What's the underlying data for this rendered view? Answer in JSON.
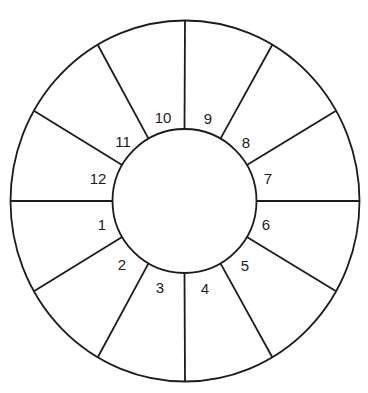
{
  "diagram": {
    "type": "segmented-ring",
    "center": [
      184.5,
      201
    ],
    "outer_radius": 178,
    "inner_radius": 72,
    "stroke_color": "#1c1c1c",
    "segment_count": 12,
    "segments": [
      {
        "label": "1",
        "x": 102,
        "y": 224
      },
      {
        "label": "2",
        "x": 122,
        "y": 264
      },
      {
        "label": "3",
        "x": 160,
        "y": 287
      },
      {
        "label": "4",
        "x": 205,
        "y": 288
      },
      {
        "label": "5",
        "x": 245,
        "y": 265
      },
      {
        "label": "6",
        "x": 266,
        "y": 224
      },
      {
        "label": "7",
        "x": 268,
        "y": 178
      },
      {
        "label": "8",
        "x": 246,
        "y": 142
      },
      {
        "label": "9",
        "x": 208,
        "y": 118
      },
      {
        "label": "10",
        "x": 163,
        "y": 117
      },
      {
        "label": "11",
        "x": 123,
        "y": 141
      },
      {
        "label": "12",
        "x": 98,
        "y": 178
      }
    ]
  }
}
